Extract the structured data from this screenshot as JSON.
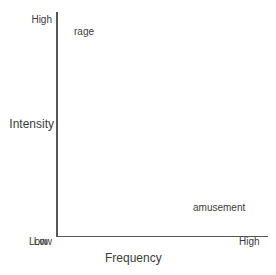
{
  "chart_data": {
    "type": "scatter",
    "title": "",
    "xlabel": "Frequency",
    "ylabel": "Intensity",
    "grid": false,
    "legend": "none",
    "x_tick_labels": [
      "Low",
      "High"
    ],
    "y_tick_labels": [
      "Low",
      "High"
    ],
    "xlim": [
      "Low",
      "High"
    ],
    "ylim": [
      "Low",
      "High"
    ],
    "annotations": [
      {
        "label": "rage",
        "x": "Low",
        "y": "High"
      },
      {
        "label": "amusement",
        "x": "High",
        "y": "Low"
      }
    ],
    "axis_color": "#555555",
    "text_color": "#3c3c3c",
    "background_color": "#ffffff"
  },
  "axes": {
    "y": {
      "title": "Intensity",
      "tick_high": "High",
      "tick_low": "Low"
    },
    "x": {
      "title": "Frequency",
      "tick_high": "High",
      "tick_low": "Low"
    }
  },
  "points": {
    "rage": "rage",
    "amusement": "amusement"
  }
}
